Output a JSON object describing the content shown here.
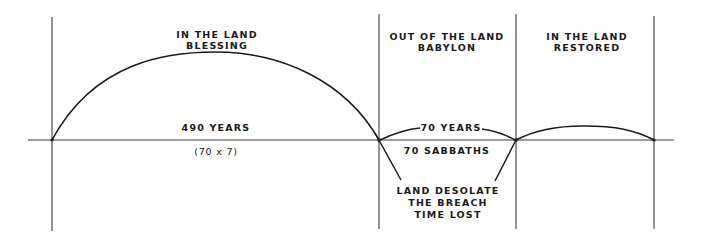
{
  "diagram": {
    "colors": {
      "ink": "#1a1a1a",
      "background": "#ffffff"
    },
    "periods": [
      {
        "title": "IN THE LAND",
        "subtitle": "BLESSING",
        "duration": "490 YEARS",
        "note": "(70 x 7)"
      },
      {
        "title": "OUT OF THE LAND",
        "subtitle": "BABYLON",
        "duration": "70 YEARS",
        "note": "70 SABBATHS"
      },
      {
        "title": "IN THE LAND",
        "subtitle": "RESTORED"
      }
    ],
    "callout": {
      "lines": [
        "LAND DESOLATE",
        "THE BREACH",
        "TIME LOST"
      ]
    }
  }
}
